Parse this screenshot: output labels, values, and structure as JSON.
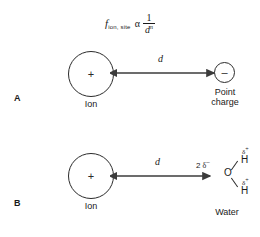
{
  "figure": {
    "formula": {
      "f_symbol": "f",
      "f_subscript": "ion, site",
      "proportional_symbol": "α",
      "fraction_numerator": "1",
      "fraction_denominator": "d",
      "fraction_exponent": "n"
    },
    "panels": [
      {
        "letter": "A",
        "ion": {
          "sign": "+",
          "label": "Ion"
        },
        "distance_label": "d",
        "target": {
          "kind": "point-charge",
          "sign": "–",
          "label_line1": "Point",
          "label_line2": "charge"
        }
      },
      {
        "letter": "B",
        "ion": {
          "sign": "+",
          "label": "Ion"
        },
        "distance_label": "d",
        "target": {
          "kind": "water-molecule",
          "oxygen": "O",
          "oxygen_charge_count": "2",
          "oxygen_charge_delta": "δ",
          "oxygen_charge_sign": "–",
          "hydrogen_top": "H",
          "hydrogen_bottom": "H",
          "hydrogen_delta": "δ",
          "hydrogen_charge_sign": "+",
          "label": "Water"
        }
      }
    ],
    "colors": {
      "stroke": "#2b2b2b",
      "text": "#1a1a1a",
      "background": "#ffffff"
    }
  }
}
